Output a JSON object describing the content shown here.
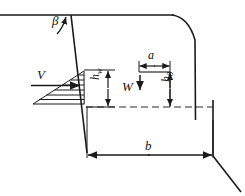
{
  "figure": {
    "title": "",
    "type": "engineering-cross-section"
  },
  "labels": {
    "beta": "β",
    "v_force": "V",
    "w_force": "W",
    "h_w": "h",
    "h_w_sub": "w",
    "h_zero": "h",
    "h_zero_sub": "0",
    "a_dim": "a",
    "b_dim": "b"
  },
  "geometry": {
    "water_surface_line": {
      "x1": 0,
      "y1": 15,
      "x2": 174,
      "y2": 15
    },
    "upstream_face": {
      "x1": 71,
      "y1": 15,
      "x2": 87,
      "y2": 153
    },
    "crest_curve": "M172,15 C184,17 192,26 196,40 L196,145",
    "downstream_face_vertical": {
      "x1": 213,
      "y1": 107,
      "x2": 213,
      "y2": 155
    },
    "downstream_face_slope": {
      "x1": 213,
      "y1": 155,
      "x2": 240,
      "y2": 190
    },
    "base_dashed_line": {
      "x1": 85,
      "y1": 107,
      "x2": 215,
      "y2": 107
    },
    "pressure_triangle_lines": 7,
    "pressure_triangle_apex": {
      "x": 84,
      "y": 71
    },
    "pressure_triangle_base_left": {
      "x": 33,
      "y": 104
    }
  },
  "colors": {
    "line": "#1a1a1a",
    "background": "#ffffff",
    "dashed": "#2b2b2b"
  },
  "dimensions": {
    "h_w_label": "water depth on upstream face",
    "h_zero_label": "crest height above base",
    "a_label": "crest width",
    "b_label": "base width"
  }
}
